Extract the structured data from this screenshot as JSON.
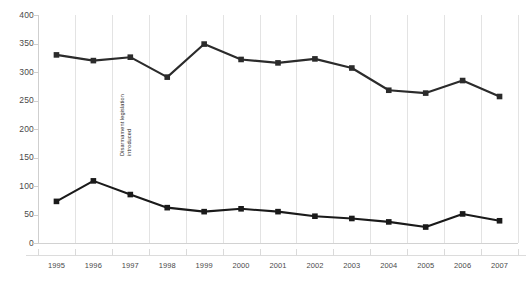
{
  "chart_data": {
    "type": "line",
    "title": "",
    "subtitle": "",
    "xlabel": "",
    "ylabel": "",
    "categories": [
      "1995",
      "1996",
      "1997",
      "1998",
      "1999",
      "2000",
      "2001",
      "2002",
      "2003",
      "2004",
      "2005",
      "2006",
      "2007"
    ],
    "x": [
      1995,
      1996,
      1997,
      1998,
      1999,
      2000,
      2001,
      2002,
      2003,
      2004,
      2005,
      2006,
      2007
    ],
    "ylim": [
      0,
      400
    ],
    "yticks": [
      0,
      50,
      100,
      150,
      200,
      250,
      300,
      350,
      400
    ],
    "ytick_labels": [
      "0",
      "50",
      "100",
      "150",
      "200",
      "250",
      "300",
      "350",
      "400"
    ],
    "grid": "vertical",
    "legend": "none",
    "series": [
      {
        "name": "upper-series",
        "color": "#2b2b2b",
        "marker": "square",
        "values": [
          330,
          320,
          326,
          291,
          349,
          322,
          316,
          323,
          307,
          268,
          263,
          285,
          257
        ]
      },
      {
        "name": "lower-series",
        "color": "#1a1a1a",
        "marker": "square",
        "values": [
          73,
          109,
          85,
          62,
          55,
          60,
          55,
          47,
          43,
          37,
          28,
          51,
          39
        ]
      }
    ],
    "annotations": [
      {
        "name": "disarmament-legislation-annotation",
        "line1": "Disarmament legislation",
        "line2": "introduced",
        "at_x": "1997",
        "orientation": "vertical"
      }
    ]
  },
  "colors": {
    "series_dark": "#2b2b2b",
    "gridline": "#e3e3e3",
    "axis": "#cfcfcf",
    "tick_text": "#4a4a4a",
    "background": "#ffffff"
  }
}
